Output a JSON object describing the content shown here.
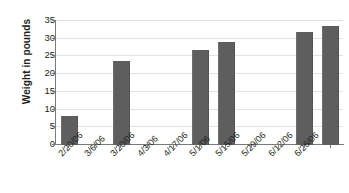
{
  "chart_data": {
    "type": "bar",
    "title": "",
    "xlabel": "",
    "ylabel": "Weight in pounds",
    "ylim": [
      0,
      35
    ],
    "ytick_values": [
      0,
      5,
      10,
      15,
      20,
      25,
      30,
      35
    ],
    "ytick_labels": [
      "0",
      "5",
      "10",
      "15",
      "20",
      "25",
      "30",
      "35"
    ],
    "grid": "horizontal",
    "legend": "none",
    "bar_color": "#5e5e5e",
    "categories": [
      "2/20/06",
      "3/6/06",
      "3/20/06",
      "4/3/06",
      "4/17/06",
      "5/1/06",
      "5/15/06",
      "5/29/06",
      "6/12/06",
      "6/26/06",
      ""
    ],
    "values": [
      7.8,
      0,
      23.3,
      0,
      0,
      26.5,
      28.8,
      0,
      0,
      31.7,
      33.2
    ],
    "points": [
      {
        "x": "2/20/06",
        "y": 7.8
      },
      {
        "x": "3/6/06",
        "y": 0
      },
      {
        "x": "3/20/06",
        "y": 23.3
      },
      {
        "x": "4/3/06",
        "y": 0
      },
      {
        "x": "4/17/06",
        "y": 0
      },
      {
        "x": "5/1/06",
        "y": 26.5
      },
      {
        "x": "5/15/06",
        "y": 28.8
      },
      {
        "x": "5/29/06",
        "y": 0
      },
      {
        "x": "6/12/06",
        "y": 0
      },
      {
        "x": "6/26/06",
        "y": 31.7
      },
      {
        "x": "",
        "y": 33.2
      }
    ]
  }
}
